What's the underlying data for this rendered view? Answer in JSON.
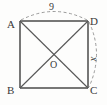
{
  "figure": {
    "type": "geometry-diagram",
    "shape": "square",
    "background_color": "#fdfdfc",
    "stroke_color": "#4a4a4a",
    "dashed_stroke_color": "#8a8a8a",
    "label_color": "#3a3a3a",
    "vertices": [
      {
        "name": "A",
        "label": "A",
        "position": "top-left",
        "x": 20,
        "y": 21
      },
      {
        "name": "D",
        "label": "D",
        "position": "top-right",
        "x": 88,
        "y": 21
      },
      {
        "name": "B",
        "label": "B",
        "position": "bottom-left",
        "x": 20,
        "y": 88
      },
      {
        "name": "C",
        "label": "C",
        "position": "bottom-right",
        "x": 88,
        "y": 88
      }
    ],
    "center": {
      "name": "O",
      "label": "O",
      "x": 54,
      "y": 54.5
    },
    "edges": [
      {
        "from": "A",
        "to": "D",
        "style": "solid"
      },
      {
        "from": "D",
        "to": "C",
        "style": "solid"
      },
      {
        "from": "C",
        "to": "B",
        "style": "solid"
      },
      {
        "from": "B",
        "to": "A",
        "style": "solid"
      }
    ],
    "diagonals": [
      {
        "from": "A",
        "to": "C",
        "style": "solid"
      },
      {
        "from": "B",
        "to": "D",
        "style": "solid"
      }
    ],
    "measures": [
      {
        "name": "top-arc",
        "label": "9",
        "style": "dashed-arc",
        "spans": "A-D",
        "side": "top",
        "bulge": "outward"
      },
      {
        "name": "right-arc",
        "label": "x",
        "style": "dashed-arc",
        "spans": "D-C",
        "side": "right",
        "bulge": "outward",
        "italic": true,
        "rotated": true
      }
    ]
  }
}
